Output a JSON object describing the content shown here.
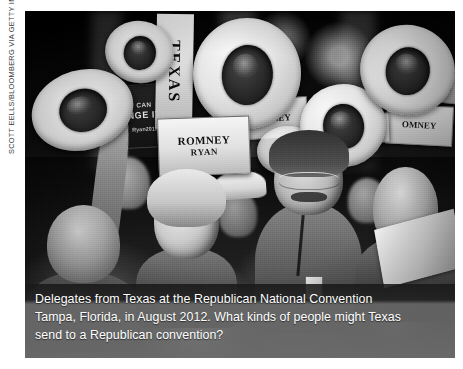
{
  "figure": {
    "photo_credit": "SCOTT EELLS/BLOOMBERG VIA GETTY IMAGES",
    "caption": {
      "line1": "Delegates from Texas at the Republican National Convention",
      "line2": "Tampa, Florida, in August 2012. What kinds of people might Texas",
      "line3": "send to a Republican convention?"
    },
    "photo": {
      "description": "Black-and-white photograph of Texas delegates raising white cowboy hats at the 2012 Republican National Convention",
      "signs": {
        "texas_banner": "TEXAS",
        "romney_ryan_line1": "ROMNEY",
        "romney_ryan_line2": "RYAN",
        "change_sign_line1": "CAN",
        "change_sign_line2": "NGE IT",
        "change_sign_line3": "Ryan2012",
        "romney_small_a": "MNEY",
        "romney_small_b": "OMNEY",
        "romney_small_c": "MN",
        "romney_small_d": "OMN"
      }
    },
    "colors": {
      "page_background": "#ffffff",
      "caption_band_top": "#1a1a1a",
      "caption_band_body": "#7a7a7a",
      "caption_text": "#ffffff",
      "credit_text": "#3b3b3b"
    }
  }
}
